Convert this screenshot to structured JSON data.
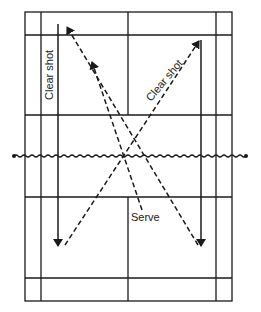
{
  "diagram": {
    "type": "badminton-court-shots",
    "labels": {
      "clear_shot_left": "Clear shot",
      "clear_shot_right": "Clear shot",
      "serve": "Serve"
    },
    "colors": {
      "line": "#1a1a1a",
      "background": "#ffffff"
    }
  }
}
